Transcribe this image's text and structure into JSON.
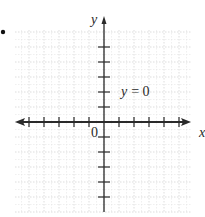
{
  "chart_data": {
    "type": "line",
    "title": "",
    "xlabel": "x",
    "ylabel": "y",
    "origin_label": "0",
    "annotation": "y = 0",
    "series": [
      {
        "name": "y = 0",
        "x": [
          -5,
          5
        ],
        "y": [
          0,
          0
        ]
      }
    ],
    "xlim": [
      -6,
      6
    ],
    "ylim": [
      -6,
      6
    ],
    "x_ticks_per_side": 5,
    "y_ticks_per_side": 5,
    "grid": true,
    "legend": "none"
  },
  "bullet": "•",
  "labels": {
    "x_axis": "x",
    "y_axis": "y",
    "origin": "0",
    "equation": "y = 0"
  },
  "colors": {
    "axis": "#2a2a2a",
    "grid_major": "#d4d4d4",
    "grid_minor": "#e6e6e6",
    "background": "#ffffff"
  }
}
